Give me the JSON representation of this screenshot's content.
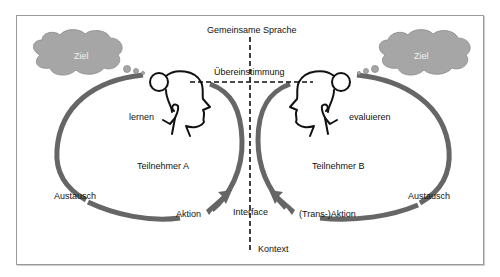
{
  "diagram": {
    "colors": {
      "loop": "#666666",
      "cloud_fill": "#a6a6a6",
      "cloud_stroke": "#8c8c8c",
      "cloud_text": "#f2f2f2",
      "line": "#111111",
      "frame": "#9a9a9a"
    },
    "labels": {
      "shared_language": "Gemeinsame Sprache",
      "agreement": "Übereinstimmung",
      "interface": "Interface",
      "context": "Kontext"
    },
    "participant_a": {
      "name": "Teilnehmer A",
      "goal": "Ziel",
      "process": "lernen",
      "exchange": "Austausch",
      "action": "Aktion"
    },
    "participant_b": {
      "name": "Teilnehmer B",
      "goal": "Ziel",
      "process": "evaluieren",
      "exchange": "Austausch",
      "action": "(Trans-)Aktion"
    }
  }
}
